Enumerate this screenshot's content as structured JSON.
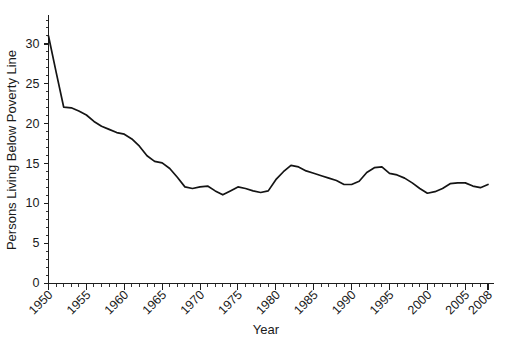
{
  "chart_data": {
    "type": "line",
    "title": "",
    "xlabel": "Year",
    "ylabel": "Persons Living Below Poverty Line",
    "xlim": [
      1950,
      2008
    ],
    "ylim": [
      0,
      33
    ],
    "grid": false,
    "legend": "none",
    "line_color": "#141414",
    "x": [
      1950,
      1951,
      1952,
      1953,
      1954,
      1955,
      1956,
      1957,
      1958,
      1959,
      1960,
      1961,
      1962,
      1963,
      1964,
      1965,
      1966,
      1967,
      1968,
      1969,
      1970,
      1971,
      1972,
      1973,
      1974,
      1975,
      1976,
      1977,
      1978,
      1979,
      1980,
      1981,
      1982,
      1983,
      1984,
      1985,
      1986,
      1987,
      1988,
      1989,
      1990,
      1991,
      1992,
      1993,
      1994,
      1995,
      1996,
      1997,
      1998,
      1999,
      2000,
      2001,
      2002,
      2003,
      2004,
      2005,
      2006,
      2007,
      2008
    ],
    "values": [
      31.0,
      26.5,
      22.1,
      22.0,
      21.6,
      21.1,
      20.3,
      19.7,
      19.3,
      18.9,
      18.7,
      18.1,
      17.2,
      16.0,
      15.3,
      15.1,
      14.4,
      13.3,
      12.1,
      11.9,
      12.1,
      12.2,
      11.6,
      11.1,
      11.6,
      12.1,
      11.9,
      11.6,
      11.4,
      11.6,
      13.0,
      14.0,
      14.8,
      14.6,
      14.1,
      13.8,
      13.5,
      13.2,
      12.9,
      12.4,
      12.4,
      12.8,
      13.9,
      14.5,
      14.6,
      13.8,
      13.6,
      13.2,
      12.6,
      11.9,
      11.3,
      11.5,
      11.9,
      12.5,
      12.6,
      12.6,
      12.2,
      12.0,
      12.4
    ],
    "ytick_labels": [
      "0",
      "5",
      "10",
      "15",
      "20",
      "25",
      "30"
    ],
    "ytick_values": [
      0,
      5,
      10,
      15,
      20,
      25,
      30
    ],
    "xtick_labels": [
      "1950",
      "1955",
      "1960",
      "1965",
      "1970",
      "1975",
      "1980",
      "1985",
      "1990",
      "1995",
      "2000",
      "2005",
      "2008"
    ],
    "xtick_values": [
      1950,
      1955,
      1960,
      1965,
      1970,
      1975,
      1980,
      1985,
      1990,
      1995,
      2000,
      2005,
      2008
    ]
  }
}
